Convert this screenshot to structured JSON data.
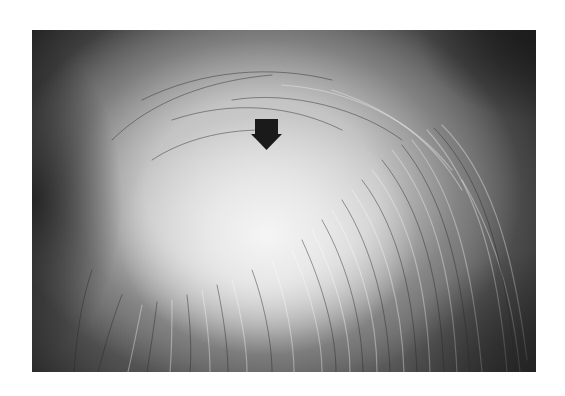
{
  "figure": {
    "photo_bounds": {
      "x": 32,
      "y": 30,
      "width": 504,
      "height": 342
    },
    "arrow": {
      "icon": "arrow-down-icon",
      "color": "#1a1a1a",
      "shaft": {
        "x": 223,
        "y": 89,
        "width": 23,
        "height": 18
      },
      "head_points": "219,104 250,104 234.5,120"
    },
    "colors": {
      "background": "#ffffff",
      "dark_hair": "#2a2a2a",
      "scalp_light": "#f0f0f0"
    }
  }
}
